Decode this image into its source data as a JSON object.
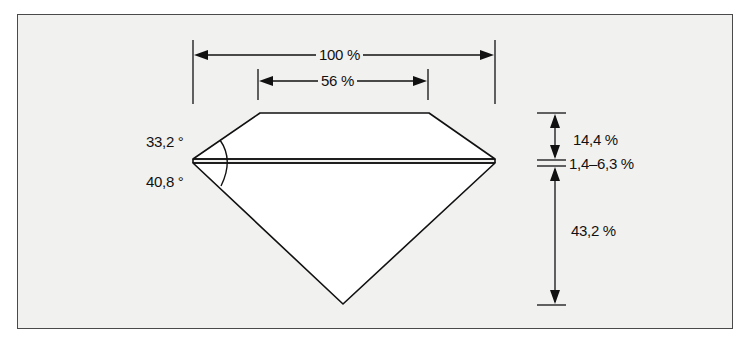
{
  "diagram": {
    "colors": {
      "background": "#f1f1f0",
      "line": "#111111",
      "stone": "#ffffff",
      "frame": "#4a4a4a"
    },
    "labels": {
      "total_diameter": "100 %",
      "table": "56 %",
      "crown_angle": "33,2 °",
      "pavilion_angle": "40,8 °",
      "crown_height": "14,4 %",
      "girdle": "1,4–6,3 %",
      "pavilion_depth": "43,2 %"
    }
  }
}
